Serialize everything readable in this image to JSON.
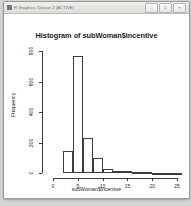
{
  "window": {
    "title": "R Graphics: Device 2 (ACTIVE)",
    "icon": "r-graphics-icon",
    "buttons": [
      {
        "name": "minimize-button",
        "glyph": "–"
      },
      {
        "name": "maximize-button",
        "glyph": "□"
      },
      {
        "name": "close-button",
        "glyph": "×"
      }
    ]
  },
  "chart_data": {
    "type": "bar",
    "title": "Histogram of subWoman$incentive",
    "xlabel": "subWoman$incentive",
    "ylabel": "Frequency",
    "xlim": [
      -1,
      26
    ],
    "ylim": [
      0,
      800
    ],
    "grid": false,
    "legend": null,
    "xticks": [
      0,
      5,
      10,
      15,
      20,
      25
    ],
    "xtick_labels": [
      "0",
      "5",
      "10",
      "15",
      "20",
      "25"
    ],
    "yticks": [
      0,
      200,
      400,
      600,
      800
    ],
    "ytick_labels": [
      "0",
      "200",
      "400",
      "600",
      "800"
    ],
    "bin_width": 2,
    "bin_starts": [
      2,
      4,
      6,
      8,
      10,
      12,
      14,
      16,
      18,
      20,
      22,
      24
    ],
    "categories": [
      "2-4",
      "4-6",
      "6-8",
      "8-10",
      "10-12",
      "12-14",
      "14-16",
      "16-18",
      "18-20",
      "20-22",
      "22-24",
      "24-26"
    ],
    "values": [
      145,
      770,
      230,
      100,
      28,
      14,
      16,
      6,
      4,
      3,
      2,
      2
    ]
  }
}
